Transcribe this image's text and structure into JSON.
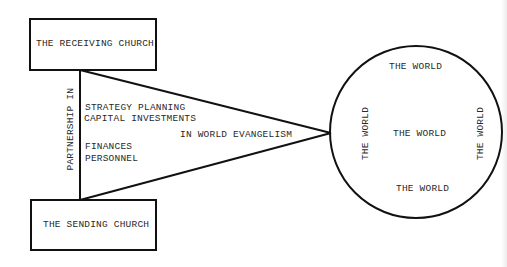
{
  "diagram": {
    "receiving_church": {
      "label": "THE RECEIVING CHURCH"
    },
    "sending_church": {
      "label": "THE SENDING CHURCH"
    },
    "connector": {
      "vertical_label": "PARTNERSHIP IN",
      "items": [
        "STRATEGY PLANNING",
        "CAPITAL INVESTMENTS",
        "FINANCES",
        "PERSONNEL"
      ],
      "apex_label": "IN WORLD EVANGELISM"
    },
    "world": {
      "top": "THE WORLD",
      "left": "THE WORLD",
      "center": "THE WORLD",
      "right": "THE WORLD",
      "bottom": "THE WORLD"
    },
    "colors": {
      "line": "#111111",
      "text": "#2a2a2a",
      "background": "#ffffff"
    }
  }
}
